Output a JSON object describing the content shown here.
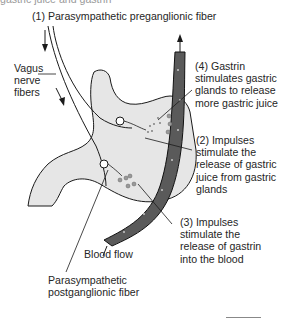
{
  "figure": {
    "cut_off_caption": "gastric juice and gastrin",
    "labels": {
      "preganglionic": "(1) Parasympathetic preganglionic fiber",
      "vagus": "Vagus\nnerve\nfibers",
      "gastrin": "(4) Gastrin\nstimulates gastric\nglands to release\nmore gastric juice",
      "impulses_juice": "(2) Impulses\nstimulate the\nrelease of gastric\njuice from gastric\nglands",
      "impulses_gastrin": "(3) Impulses\nstimulate the\nrelease of gastrin\ninto the blood",
      "blood_flow": "Blood flow",
      "postganglionic": "Parasympathetic\npostganglionic fiber"
    },
    "colors": {
      "stomach_fill": "#e6e6e6",
      "vessel_fill": "#5a5a5a",
      "line": "#1a1a1a"
    }
  }
}
